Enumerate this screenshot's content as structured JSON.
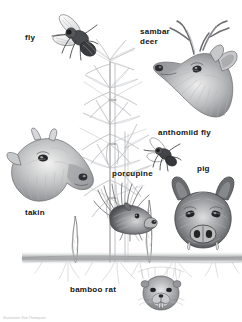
{
  "figure": {
    "kind": "scientific-illustration",
    "background_color": "#ffffff",
    "label_color": "#141414",
    "ink_color": "#58585a"
  },
  "labels": [
    {
      "id": "fly",
      "text": "fly",
      "x": 25,
      "y": 33,
      "lines": 1
    },
    {
      "id": "sambar-deer",
      "text": "sambar\ndeer",
      "x": 140,
      "y": 27,
      "lines": 2
    },
    {
      "id": "anthomiid-fly",
      "text": "anthomiid fly",
      "x": 158,
      "y": 128,
      "lines": 1
    },
    {
      "id": "porcupine",
      "text": "porcupine",
      "x": 112,
      "y": 169,
      "lines": 1
    },
    {
      "id": "pig",
      "text": "pig",
      "x": 197,
      "y": 164,
      "lines": 1
    },
    {
      "id": "takin",
      "text": "takin",
      "x": 25,
      "y": 208,
      "lines": 1
    },
    {
      "id": "bamboo-rat",
      "text": "bamboo rat",
      "x": 70,
      "y": 285,
      "lines": 1
    }
  ],
  "credit": {
    "text": "Illustration: Kim Thompson"
  },
  "scene": {
    "plant_label": "bamboo",
    "ground_label": "soil surface",
    "shoot_label": "bamboo shoot"
  }
}
